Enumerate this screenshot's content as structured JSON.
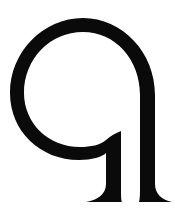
{
  "logo": {
    "name": "stylized letter q logo",
    "glyph": "q",
    "fill_color": "#0a0a0a",
    "background_color": "#ffffff"
  }
}
